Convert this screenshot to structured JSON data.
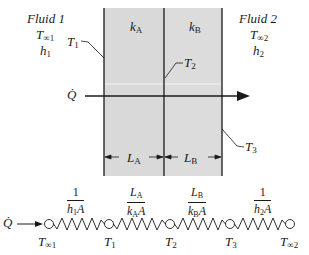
{
  "diagram": {
    "type": "composite-wall-thermal-resistance",
    "fluid_left": {
      "name": "Fluid 1",
      "temp": "T",
      "temp_sub": "∞1",
      "h": "h",
      "h_sub": "1"
    },
    "fluid_right": {
      "name": "Fluid 2",
      "temp": "T",
      "temp_sub": "∞2",
      "h": "h",
      "h_sub": "2"
    },
    "layers": [
      {
        "k": "k",
        "k_sub": "A",
        "L": "L",
        "L_sub": "A"
      },
      {
        "k": "k",
        "k_sub": "B",
        "L": "L",
        "L_sub": "B"
      }
    ],
    "surface_temps": [
      {
        "label": "T",
        "sub": "1"
      },
      {
        "label": "T",
        "sub": "2"
      },
      {
        "label": "T",
        "sub": "3"
      }
    ],
    "heat_flow_label": "Q̇",
    "colors": {
      "wall_fill": "#d9d9d9",
      "line": "#1a1a1a"
    }
  },
  "circuit": {
    "resistances": [
      {
        "num": "1",
        "den": "h",
        "den_sub": "1",
        "den_tail": "A"
      },
      {
        "num": "L",
        "num_sub": "A",
        "den": "k",
        "den_sub": "A",
        "den_tail": "A"
      },
      {
        "num": "L",
        "num_sub": "B",
        "den": "k",
        "den_sub": "B",
        "den_tail": "A"
      },
      {
        "num": "1",
        "den": "h",
        "den_sub": "2",
        "den_tail": "A"
      }
    ],
    "nodes": [
      {
        "label": "T",
        "sub": "∞1"
      },
      {
        "label": "T",
        "sub": "1"
      },
      {
        "label": "T",
        "sub": "2"
      },
      {
        "label": "T",
        "sub": "3"
      },
      {
        "label": "T",
        "sub": "∞2"
      }
    ]
  }
}
